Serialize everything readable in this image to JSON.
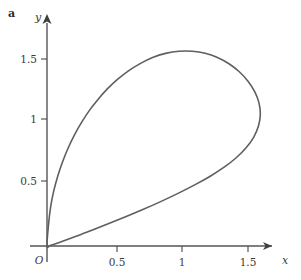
{
  "figure": {
    "panel_label": "a",
    "background_color": "#ffffff",
    "curve_color": "#5f5f5f",
    "axis_color": "#555555",
    "text_color": "#3b3b3b"
  },
  "axes": {
    "x_axis_label": "x",
    "y_axis_label": "y",
    "origin_label": "O",
    "x_ticks": [
      {
        "value": 0.5,
        "label": "0.5",
        "px": 117
      },
      {
        "value": 1.0,
        "label": "1",
        "px": 182
      },
      {
        "value": 1.5,
        "label": "1.5",
        "px": 248
      }
    ],
    "y_ticks": [
      {
        "value": 0.5,
        "label": "0.5",
        "px": 181
      },
      {
        "value": 1.0,
        "label": "1",
        "px": 119
      },
      {
        "value": 1.5,
        "label": "1.5",
        "px": 59
      }
    ],
    "origin_px": {
      "x": 47,
      "y": 246
    },
    "x_range": [
      0,
      1.92
    ],
    "y_range": [
      0,
      1.85
    ],
    "arrow_heads": [
      "x",
      "y"
    ]
  },
  "chart_data": {
    "type": "line",
    "title": "",
    "xlabel": "x",
    "ylabel": "y",
    "xlim": [
      0,
      1.92
    ],
    "ylim": [
      0,
      1.85
    ],
    "grid": false,
    "legend": false,
    "series": [
      {
        "name": "closed-loop-curve",
        "closed": true,
        "color": "#5f5f5f",
        "linewidth": 1.6,
        "annotations": [
          {
            "name": "cusp-at-origin",
            "x": 0.0,
            "y": 0.0
          },
          {
            "name": "loop-apex",
            "x": 1.13,
            "y": 1.56
          },
          {
            "name": "rightmost-point",
            "x": 1.59,
            "y": 1.05
          }
        ],
        "points": [
          [
            0.0,
            0.0
          ],
          [
            0.012,
            0.18
          ],
          [
            0.028,
            0.32
          ],
          [
            0.05,
            0.44
          ],
          [
            0.08,
            0.56
          ],
          [
            0.115,
            0.672
          ],
          [
            0.158,
            0.786
          ],
          [
            0.205,
            0.892
          ],
          [
            0.258,
            0.992
          ],
          [
            0.318,
            1.09
          ],
          [
            0.382,
            1.178
          ],
          [
            0.452,
            1.262
          ],
          [
            0.528,
            1.338
          ],
          [
            0.608,
            1.405
          ],
          [
            0.695,
            1.463
          ],
          [
            0.788,
            1.512
          ],
          [
            0.885,
            1.545
          ],
          [
            0.985,
            1.562
          ],
          [
            1.085,
            1.562
          ],
          [
            1.18,
            1.546
          ],
          [
            1.272,
            1.512
          ],
          [
            1.358,
            1.462
          ],
          [
            1.435,
            1.398
          ],
          [
            1.5,
            1.322
          ],
          [
            1.55,
            1.238
          ],
          [
            1.582,
            1.148
          ],
          [
            1.592,
            1.055
          ],
          [
            1.578,
            0.962
          ],
          [
            1.542,
            0.872
          ],
          [
            1.486,
            0.788
          ],
          [
            1.412,
            0.708
          ],
          [
            1.322,
            0.632
          ],
          [
            1.218,
            0.56
          ],
          [
            1.102,
            0.49
          ],
          [
            0.978,
            0.422
          ],
          [
            0.848,
            0.356
          ],
          [
            0.715,
            0.292
          ],
          [
            0.582,
            0.232
          ],
          [
            0.452,
            0.176
          ],
          [
            0.33,
            0.124
          ],
          [
            0.222,
            0.08
          ],
          [
            0.132,
            0.044
          ],
          [
            0.065,
            0.018
          ],
          [
            0.022,
            0.004
          ],
          [
            0.0,
            0.0
          ]
        ]
      }
    ]
  }
}
